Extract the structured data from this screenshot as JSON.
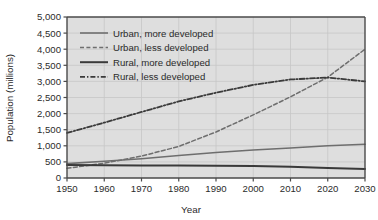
{
  "chart_data": {
    "type": "line",
    "title": "",
    "xlabel": "Year",
    "ylabel": "Population (millions)",
    "xlim": [
      1950,
      2030
    ],
    "ylim": [
      0,
      5000
    ],
    "grid": true,
    "legend_position": "top-left inside plot",
    "x": [
      1950,
      1960,
      1970,
      1980,
      1990,
      2000,
      2010,
      2020,
      2030
    ],
    "xticklabels": [
      "1950",
      "1960",
      "1970",
      "1980",
      "1990",
      "2000",
      "2010",
      "2020",
      "2030"
    ],
    "yticks": [
      0,
      500,
      1000,
      1500,
      2000,
      2500,
      3000,
      3500,
      4000,
      4500,
      5000
    ],
    "yticklabels": [
      "0",
      "500",
      "1,000",
      "1,500",
      "2,000",
      "2,500",
      "3,000",
      "3,500",
      "4,000",
      "4,500",
      "5,000"
    ],
    "series": [
      {
        "name": "Urban, more developed",
        "style": "solid",
        "color": "#6e6e6e",
        "width": 1.6,
        "values": [
          445,
          520,
          600,
          700,
          790,
          870,
          930,
          1000,
          1050
        ]
      },
      {
        "name": "Urban, less developed",
        "style": "dashed",
        "color": "#6e6e6e",
        "width": 1.5,
        "values": [
          300,
          460,
          680,
          980,
          1430,
          1960,
          2520,
          3130,
          4000
        ]
      },
      {
        "name": "Rural, more developed",
        "style": "solid",
        "color": "#3a3a3a",
        "width": 2.0,
        "values": [
          405,
          395,
          390,
          385,
          380,
          370,
          350,
          310,
          280
        ]
      },
      {
        "name": "Rural, less developed",
        "style": "dashdot",
        "color": "#3a3a3a",
        "width": 1.8,
        "values": [
          1400,
          1720,
          2050,
          2380,
          2650,
          2890,
          3060,
          3120,
          3000
        ]
      }
    ]
  },
  "legend": {
    "items": [
      {
        "label": "Urban, more developed"
      },
      {
        "label": "Urban, less developed"
      },
      {
        "label": "Rural, more developed"
      },
      {
        "label": "Rural, less developed"
      }
    ]
  },
  "colors": {
    "plot_background": "#dedede",
    "gridline": "#c6c6c6",
    "axis": "#4a4a4a",
    "text": "#2b2b2b",
    "page_background": "#ffffff"
  }
}
